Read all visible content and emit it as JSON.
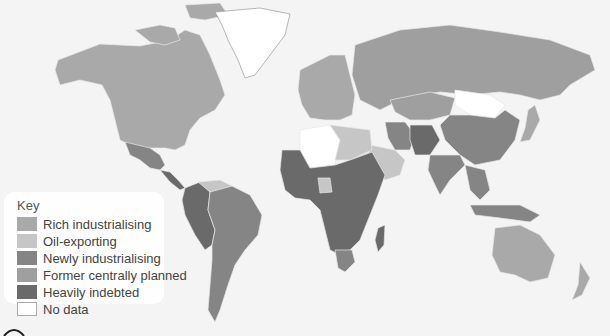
{
  "map": {
    "type": "choropleth world map",
    "background": "#f4f4f4",
    "ocean": "#f4f4f4",
    "regions": [
      {
        "name": "North America (Canada, USA)",
        "category": "Rich industrialising"
      },
      {
        "name": "Greenland",
        "category": "No data"
      },
      {
        "name": "Mexico",
        "category": "Newly industrialising"
      },
      {
        "name": "Central America",
        "category": "Heavily indebted"
      },
      {
        "name": "Colombia, Peru, Bolivia",
        "category": "Heavily indebted"
      },
      {
        "name": "Venezuela",
        "category": "Oil-exporting"
      },
      {
        "name": "Brazil, Argentina",
        "category": "Newly industrialising"
      },
      {
        "name": "Western Europe",
        "category": "Rich industrialising"
      },
      {
        "name": "Russia / USSR",
        "category": "Former centrally planned"
      },
      {
        "name": "Central Asia",
        "category": "Former centrally planned"
      },
      {
        "name": "Mongolia",
        "category": "No data"
      },
      {
        "name": "China",
        "category": "Newly industrialising"
      },
      {
        "name": "India",
        "category": "Newly industrialising"
      },
      {
        "name": "Afghanistan, Pakistan",
        "category": "Heavily indebted"
      },
      {
        "name": "Iran",
        "category": "Newly industrialising"
      },
      {
        "name": "Saudi Arabia, Gulf",
        "category": "Oil-exporting"
      },
      {
        "name": "Libya",
        "category": "Oil-exporting"
      },
      {
        "name": "Algeria / Western Sahara",
        "category": "No data"
      },
      {
        "name": "Sub-Saharan Africa",
        "category": "Heavily indebted"
      },
      {
        "name": "Nigeria",
        "category": "Oil-exporting"
      },
      {
        "name": "South Africa",
        "category": "Newly industrialising"
      },
      {
        "name": "Japan",
        "category": "Rich industrialising"
      },
      {
        "name": "Southeast Asia",
        "category": "Newly industrialising"
      },
      {
        "name": "Australia, New Zealand",
        "category": "Rich industrialising"
      }
    ]
  },
  "legend": {
    "title": "Key",
    "items": [
      {
        "label": "Rich industrialising",
        "color": "#a9a9a9"
      },
      {
        "label": "Oil-exporting",
        "color": "#c6c6c6"
      },
      {
        "label": "Newly industrialising",
        "color": "#858585"
      },
      {
        "label": "Former centrally planned",
        "color": "#9f9f9f"
      },
      {
        "label": "Heavily indebted",
        "color": "#6a6a6a"
      },
      {
        "label": "No data",
        "color": "#ffffff"
      }
    ]
  }
}
